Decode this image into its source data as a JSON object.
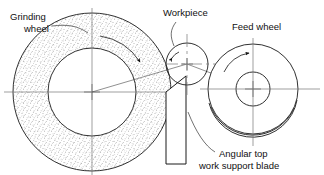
{
  "figure": {
    "background_color": "#ffffff",
    "line_color": "#1a1a1a",
    "stipple_color": "#555555",
    "centerline_color": "#777777"
  },
  "labels": {
    "grinding_wheel": {
      "line1": "Grinding",
      "line2": "wheel"
    },
    "workpiece": {
      "line1": "Workpiece"
    },
    "feed_wheel": {
      "line1": "Feed wheel"
    },
    "support_blade": {
      "line1": "Angular top",
      "line2": "work support blade"
    }
  },
  "parts": {
    "grinding_wheel": {
      "name": "grinding-wheel",
      "center_x": 92,
      "center_y": 92,
      "outer_radius": 79,
      "inner_radius": 44,
      "hatch": "stipple",
      "rotation": "clockwise"
    },
    "workpiece": {
      "name": "workpiece",
      "center_x": 187,
      "center_y": 64,
      "radius": 21,
      "rotation": "clockwise"
    },
    "feed_wheel": {
      "name": "feed-wheel",
      "center_x": 253,
      "center_y": 89,
      "outer_radius": 45,
      "inner_radius": 17,
      "rim_offset": 4,
      "rotation": "clockwise"
    },
    "support_blade": {
      "name": "work-support-blade",
      "left_x": 166,
      "right_x": 186,
      "top_left_y": 92,
      "top_right_y": 76,
      "bottom_y": 164,
      "top_style": "angular"
    }
  },
  "icons": {
    "rotation_arrow": "curved-rotation-arrow-icon",
    "leader_line": "leader-line-icon",
    "center_mark": "center-cross-icon"
  }
}
